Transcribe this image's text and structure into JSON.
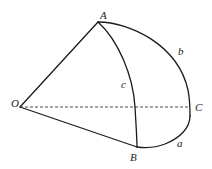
{
  "diagram": {
    "type": "spherical-triangle",
    "colors": {
      "line": "#1a1a1a",
      "dashed": "#333333",
      "text": "#222222",
      "background": "#ffffff"
    },
    "points": {
      "O": {
        "label": "O",
        "x": 20,
        "y": 107
      },
      "A": {
        "label": "A",
        "x": 98,
        "y": 22
      },
      "B": {
        "label": "B",
        "x": 137,
        "y": 147
      },
      "C": {
        "label": "C",
        "x": 190,
        "y": 107
      }
    },
    "arc_labels": {
      "a": {
        "label": "a",
        "x": 179,
        "y": 146
      },
      "b": {
        "label": "b",
        "x": 180,
        "y": 55
      },
      "c": {
        "label": "c",
        "x": 121,
        "y": 88
      }
    },
    "segments": [
      {
        "name": "OA",
        "style": "solid"
      },
      {
        "name": "OB",
        "style": "solid"
      },
      {
        "name": "OC",
        "style": "dashed"
      }
    ],
    "arcs": [
      {
        "name": "arc-AC",
        "label": "b"
      },
      {
        "name": "arc-CB",
        "label": "a"
      },
      {
        "name": "arc-AB",
        "label": "c"
      }
    ]
  }
}
